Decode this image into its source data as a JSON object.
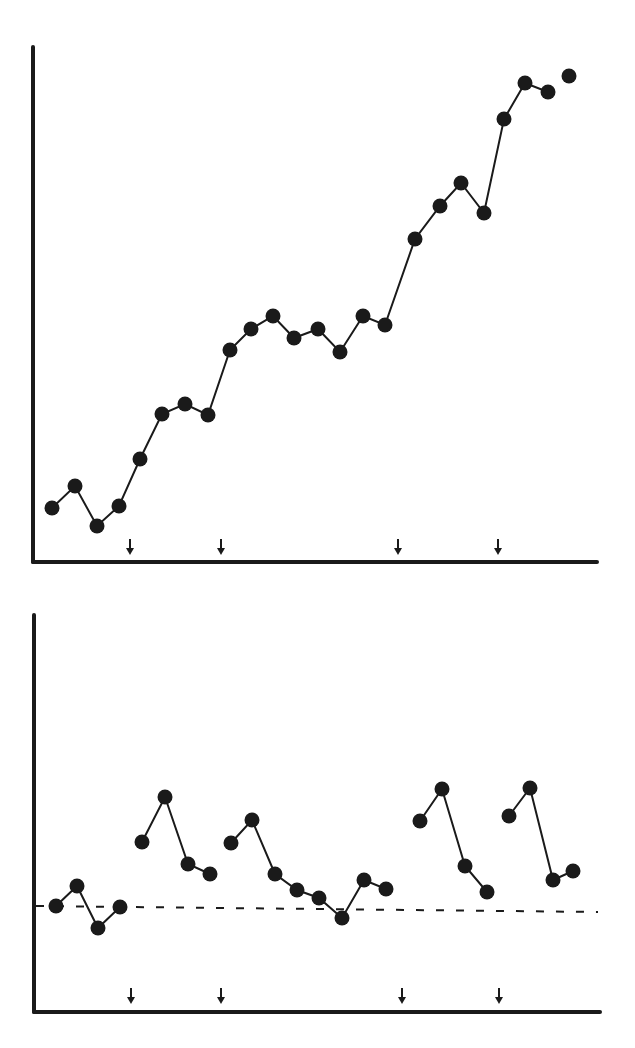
{
  "colors": {
    "ink": "#1a1a1a",
    "background": "#ffffff"
  },
  "chart_data": [
    {
      "type": "line",
      "title": "",
      "xlabel": "",
      "ylabel": "",
      "grid": false,
      "legend": null,
      "x": [
        1,
        2,
        3,
        4,
        5,
        6,
        7,
        8,
        9,
        10,
        11,
        12,
        13,
        14,
        15,
        16,
        17,
        18,
        19,
        20,
        21,
        22,
        23,
        24,
        25
      ],
      "series": [
        {
          "name": "cumulative",
          "values": [
            5.4,
            7.6,
            3.6,
            5.6,
            10.3,
            14.8,
            15.8,
            14.7,
            21.2,
            23.3,
            24.6,
            22.4,
            23.3,
            21.0,
            24.6,
            23.7,
            32.3,
            35.6,
            37.9,
            34.9,
            44.3,
            47.9,
            47.0,
            48.6
          ],
          "x": [
            1,
            2,
            3,
            4,
            5,
            6,
            7,
            8,
            9,
            10,
            11,
            12,
            13,
            14,
            15,
            16,
            17,
            18,
            19,
            20,
            21,
            22,
            23,
            24
          ],
          "connected_segments": [
            [
              1,
              23
            ]
          ],
          "isolated_points": [
            24
          ]
        }
      ],
      "markers": {
        "type": "down-arrow",
        "description": "intervention points on x-axis",
        "x_after_point": [
          4,
          8,
          16,
          20
        ]
      },
      "ylim": [
        0,
        51.5
      ],
      "units": "arbitrary (px/10 above axis)"
    },
    {
      "type": "line",
      "title": "",
      "xlabel": "",
      "ylabel": "",
      "grid": false,
      "legend": null,
      "baseline": {
        "value": 10.5,
        "style": "dashed"
      },
      "series": [
        {
          "name": "segment-1",
          "x": [
            1,
            2,
            3,
            4
          ],
          "values": [
            10.6,
            12.6,
            8.4,
            10.5
          ]
        },
        {
          "name": "segment-2",
          "x": [
            5,
            6,
            7,
            8
          ],
          "values": [
            17.0,
            21.5,
            14.8,
            13.8
          ]
        },
        {
          "name": "segment-3",
          "x": [
            9,
            10,
            11,
            12,
            13,
            14,
            15,
            16
          ],
          "values": [
            16.9,
            19.2,
            13.8,
            12.2,
            11.4,
            9.4,
            13.2,
            12.3
          ]
        },
        {
          "name": "segment-4",
          "x": [
            17,
            18,
            19,
            20
          ],
          "values": [
            19.1,
            22.3,
            14.6,
            12.0
          ]
        },
        {
          "name": "segment-5",
          "x": [
            21,
            22,
            23,
            24
          ],
          "values": [
            19.6,
            22.4,
            13.2,
            14.1
          ]
        }
      ],
      "markers": {
        "type": "down-arrow",
        "description": "intervention points on x-axis",
        "x_after_point": [
          4,
          8,
          16,
          20
        ]
      },
      "ylim": [
        0,
        39.7
      ],
      "units": "arbitrary (px/10 above axis)"
    }
  ],
  "render": {
    "top": {
      "axis": {
        "x0": 33,
        "y0": 562,
        "ytop": 47,
        "xend": 597
      },
      "points": [
        [
          52,
          508
        ],
        [
          75,
          486
        ],
        [
          97,
          526
        ],
        [
          119,
          506
        ],
        [
          140,
          459
        ],
        [
          162,
          414
        ],
        [
          185,
          404
        ],
        [
          208,
          415
        ],
        [
          230,
          350
        ],
        [
          251,
          329
        ],
        [
          273,
          316
        ],
        [
          294,
          338
        ],
        [
          318,
          329
        ],
        [
          340,
          352
        ],
        [
          363,
          316
        ],
        [
          385,
          325
        ],
        [
          415,
          239
        ],
        [
          440,
          206
        ],
        [
          461,
          183
        ],
        [
          484,
          213
        ],
        [
          504,
          119
        ],
        [
          525,
          83
        ],
        [
          548,
          92
        ]
      ],
      "isolated": [
        [
          569,
          76
        ]
      ],
      "arrows": [
        130,
        221,
        398,
        498
      ],
      "arrow_tip_y": 555
    },
    "bottom": {
      "axis": {
        "x0": 34,
        "y0": 1012,
        "ytop": 615,
        "xend": 600
      },
      "dashed": {
        "x1": 36,
        "y1": 906,
        "x2": 598,
        "y2": 912
      },
      "segments": [
        [
          [
            56,
            906
          ],
          [
            77,
            886
          ],
          [
            98,
            928
          ],
          [
            120,
            907
          ]
        ],
        [
          [
            142,
            842
          ],
          [
            165,
            797
          ],
          [
            188,
            864
          ],
          [
            210,
            874
          ]
        ],
        [
          [
            231,
            843
          ],
          [
            252,
            820
          ],
          [
            275,
            874
          ],
          [
            297,
            890
          ],
          [
            319,
            898
          ],
          [
            342,
            918
          ],
          [
            364,
            880
          ],
          [
            386,
            889
          ]
        ],
        [
          [
            420,
            821
          ],
          [
            442,
            789
          ],
          [
            465,
            866
          ],
          [
            487,
            892
          ]
        ],
        [
          [
            509,
            816
          ],
          [
            530,
            788
          ],
          [
            553,
            880
          ],
          [
            573,
            871
          ]
        ]
      ],
      "arrows": [
        131,
        221,
        402,
        499
      ],
      "arrow_tip_y": 1004
    }
  }
}
